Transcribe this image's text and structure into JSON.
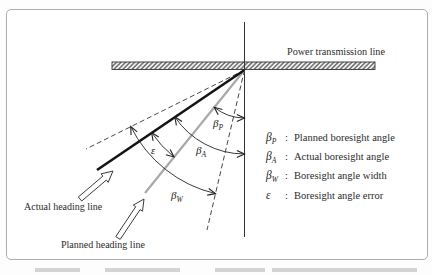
{
  "figure": {
    "power_line_label": "Power transmission line",
    "actual_heading_label": "Actual heading line",
    "planned_heading_label": "Planned heading line",
    "angles": {
      "planned": {
        "sym": "β",
        "sub": "P"
      },
      "actual": {
        "sym": "β",
        "sub": "A"
      },
      "width": {
        "sym": "β",
        "sub": "W"
      },
      "error": {
        "sym": "ε",
        "sub": ""
      }
    },
    "legend": {
      "items": [
        {
          "sym": "β",
          "sub": "P",
          "colon": ":",
          "desc": "Planned boresight angle"
        },
        {
          "sym": "β",
          "sub": "A",
          "colon": ":",
          "desc": "Actual boresight angle"
        },
        {
          "sym": "β",
          "sub": "W",
          "colon": ":",
          "desc": "Boresight angle width"
        },
        {
          "sym": "ε",
          "sub": "",
          "colon": ":",
          "desc": "Boresight angle error"
        }
      ]
    },
    "colors": {
      "line_dark": "#1c1c1c",
      "line_gray": "#a9a9a9",
      "stroke": "#2e2e2e",
      "border": "#a9adb2"
    }
  }
}
